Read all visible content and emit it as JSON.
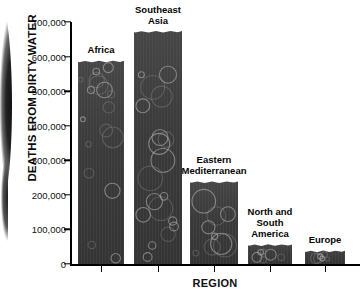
{
  "chart_data": {
    "type": "bar",
    "title": "",
    "xlabel": "REGION",
    "ylabel": "DEATHS FROM DIRTY WATER",
    "categories": [
      "Africa",
      "Southeast Asia",
      "Eastern Mediterranean",
      "North and South America",
      "Europe"
    ],
    "values": [
      592000,
      678000,
      243000,
      61000,
      43000
    ],
    "ylim": [
      0,
      700000
    ],
    "ytick_values": [
      0,
      100000,
      200000,
      300000,
      400000,
      500000,
      600000,
      700000
    ],
    "ytick_labels": [
      "0",
      "100,000",
      "200,000",
      "300,000",
      "400,000",
      "500,000",
      "600,000",
      "700,000"
    ],
    "grid": false,
    "legend": "none",
    "bar_color": "#3b3b3b",
    "bar_texture": "bubbles"
  },
  "bars": [
    {
      "label": "Africa",
      "label_lines": "Africa",
      "value": 592000
    },
    {
      "label": "Southeast Asia",
      "label_lines": "Southeast\nAsia",
      "value": 678000
    },
    {
      "label": "Eastern Mediterranean",
      "label_lines": "Eastern\nMediterranean",
      "value": 243000
    },
    {
      "label": "North and South America",
      "label_lines": "North and\nSouth\nAmerica",
      "value": 61000
    },
    {
      "label": "Europe",
      "label_lines": "Europe",
      "value": 43000
    }
  ],
  "axis": {
    "y_title": "DEATHS FROM DIRTY WATER",
    "x_title": "REGION"
  }
}
